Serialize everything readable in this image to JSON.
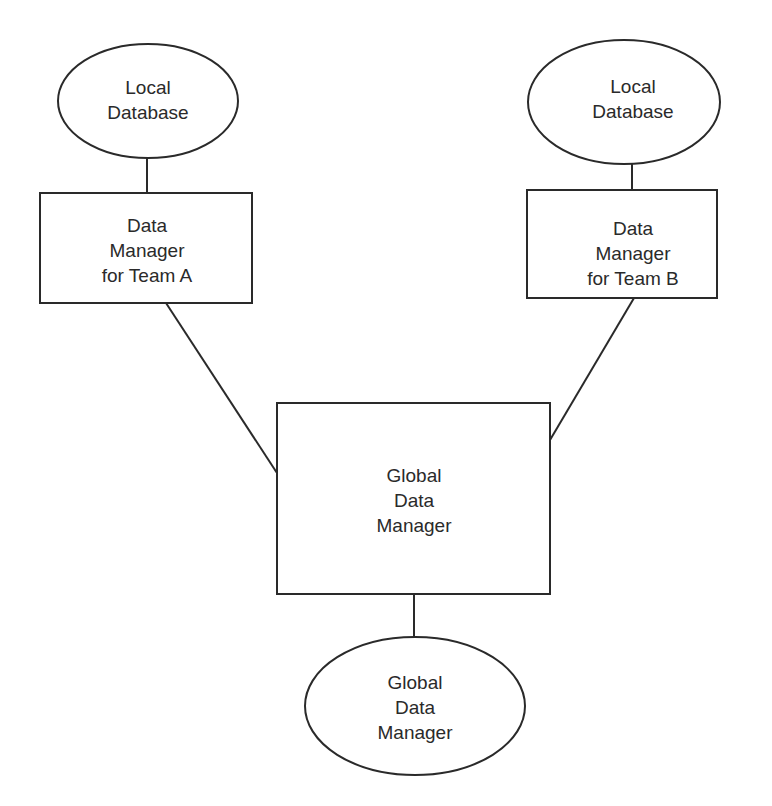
{
  "diagram": {
    "nodes": {
      "local_db_a": {
        "shape": "ellipse",
        "lines": [
          "Local",
          "Database"
        ]
      },
      "dm_team_a": {
        "shape": "rectangle",
        "lines": [
          "Data",
          "Manager",
          "for Team A"
        ]
      },
      "local_db_b": {
        "shape": "ellipse",
        "lines": [
          "Local",
          "Database"
        ]
      },
      "dm_team_b": {
        "shape": "rectangle",
        "lines": [
          "Data",
          "Manager",
          "for Team B"
        ]
      },
      "global_dm": {
        "shape": "rectangle",
        "lines": [
          "Global",
          "Data",
          "Manager"
        ]
      },
      "global_dm_store": {
        "shape": "ellipse",
        "lines": [
          "Global",
          "Data",
          "Manager"
        ]
      }
    },
    "edges": [
      {
        "from": "local_db_a",
        "to": "dm_team_a"
      },
      {
        "from": "local_db_b",
        "to": "dm_team_b"
      },
      {
        "from": "dm_team_a",
        "to": "global_dm"
      },
      {
        "from": "dm_team_b",
        "to": "global_dm"
      },
      {
        "from": "global_dm",
        "to": "global_dm_store"
      }
    ],
    "colors": {
      "stroke": "#2a2a2a",
      "background": "#ffffff"
    }
  }
}
